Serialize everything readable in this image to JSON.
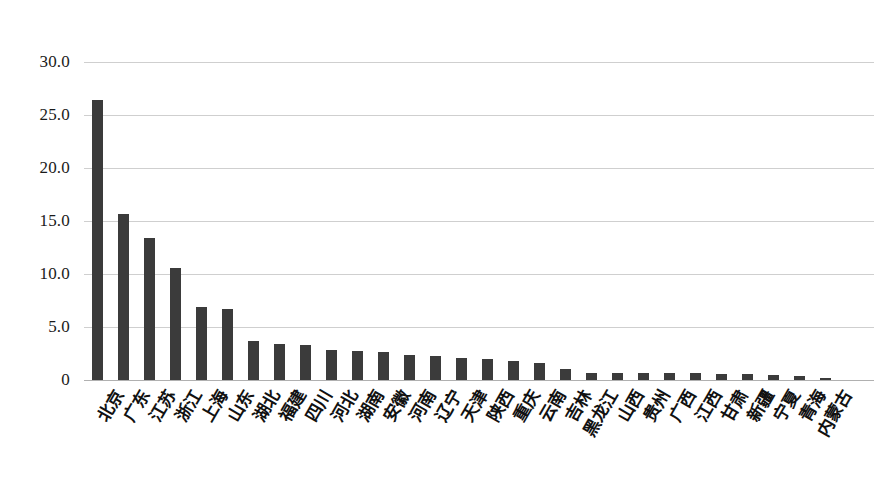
{
  "chart_data": {
    "type": "bar",
    "title": "",
    "subtitle": "",
    "xlabel": "",
    "ylabel": "",
    "ylim": [
      0,
      30
    ],
    "ytick_labels": [
      "30.0",
      "25.0",
      "20.0",
      "15.0",
      "10.0",
      "5.0",
      "0"
    ],
    "ytick_values": [
      30,
      25,
      20,
      15,
      10,
      5,
      0
    ],
    "grid": true,
    "legend": "none",
    "bar_color": "#3b3b3b",
    "gridline_color": "#cfcfcf",
    "categories": [
      "北京",
      "广东",
      "江苏",
      "浙江",
      "上海",
      "山东",
      "湖北",
      "福建",
      "四川",
      "河北",
      "湖南",
      "安徽",
      "河南",
      "辽宁",
      "天津",
      "陕西",
      "重庆",
      "云南",
      "吉林",
      "黑龙江",
      "山西",
      "贵州",
      "广西",
      "江西",
      "甘肃",
      "新疆",
      "宁夏",
      "青海",
      "内蒙古"
    ],
    "values": [
      26.4,
      15.7,
      13.4,
      10.6,
      6.9,
      6.7,
      3.7,
      3.4,
      3.3,
      2.8,
      2.7,
      2.6,
      2.4,
      2.3,
      2.1,
      2.0,
      1.8,
      1.6,
      1.0,
      0.7,
      0.7,
      0.7,
      0.7,
      0.7,
      0.6,
      0.6,
      0.5,
      0.4,
      0.2
    ]
  }
}
